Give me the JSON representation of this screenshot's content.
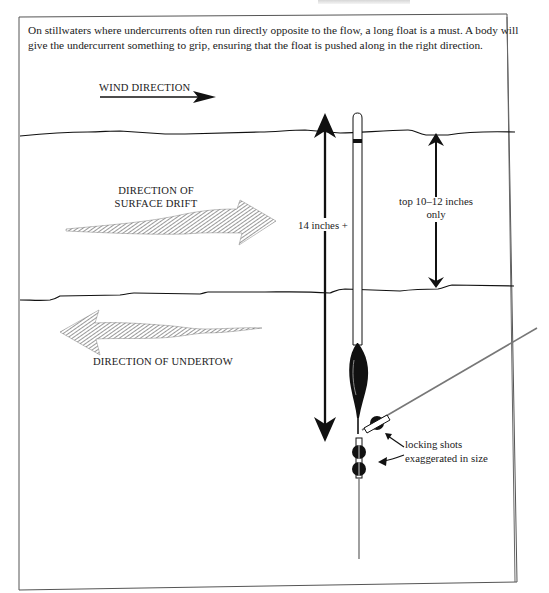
{
  "caption": "On stillwaters where undercurrents often run directly opposite to the flow, a long float is a must. A body will give the undercurrent something to grip, ensuring that the float is pushed along in the right direction.",
  "labels": {
    "wind_direction": "WIND DIRECTION",
    "surface_drift_line1": "DIRECTION OF",
    "surface_drift_line2": "SURFACE DRIFT",
    "undertow": "DIRECTION OF UNDERTOW",
    "float_length": "14 inches +",
    "top_depth_line1": "top 10–12 inches",
    "top_depth_line2": "only",
    "shots_line1": "locking shots",
    "shots_line2": "exaggerated in size"
  },
  "colors": {
    "ink": "#1a1a1a",
    "hatch": "#555555",
    "line": "#777777",
    "frame": "#555555"
  },
  "diagram": {
    "elements": [
      "wind-arrow",
      "surface-line",
      "subsurface-line",
      "surface-drift-arrow",
      "undertow-arrow",
      "float-length-arrow",
      "top-depth-arrow",
      "float",
      "float-body",
      "locking-shots",
      "line-to-rod",
      "hook-length"
    ]
  }
}
